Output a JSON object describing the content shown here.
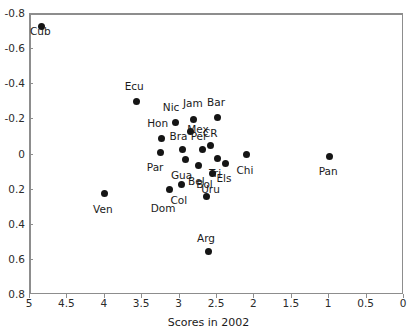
{
  "chart_data": {
    "type": "scatter",
    "title": "",
    "xlabel": "Scores in 2002",
    "ylabel": "",
    "xlim": [
      5,
      0
    ],
    "ylim": [
      -0.8,
      0.8
    ],
    "x_axis_reversed": true,
    "y_axis_reversed": true,
    "grid": false,
    "legend": "none",
    "reference_lines": [
      {
        "name": "horizontal-zero-line",
        "axis": "y",
        "value": 0
      },
      {
        "name": "vertical-line",
        "axis": "x",
        "value": 2.5
      }
    ],
    "xticks": [
      5,
      4.5,
      4,
      3.5,
      3,
      2.5,
      2,
      1.5,
      1,
      0.5,
      0
    ],
    "xtick_labels": [
      "5",
      "4.5",
      "4",
      "3.5",
      "3",
      "2.5",
      "2",
      "1.5",
      "1",
      "0.5",
      "0"
    ],
    "yticks": [
      -0.8,
      -0.6,
      -0.4,
      -0.2,
      0,
      0.2,
      0.4,
      0.6,
      0.8
    ],
    "ytick_labels": [
      "-0.8",
      "-0.6",
      "-0.4",
      "-0.2",
      "0",
      "0.2",
      "0.4",
      "0.6",
      "0.8"
    ],
    "points": [
      {
        "label": "Cub",
        "x": 4.85,
        "y": -0.73,
        "label_dx": -1,
        "label_dy": 5
      },
      {
        "label": "Ecu",
        "x": 3.58,
        "y": -0.3,
        "label_dx": -2,
        "label_dy": -16
      },
      {
        "label": "Nic",
        "x": 3.06,
        "y": -0.18,
        "label_dx": -4,
        "label_dy": -16
      },
      {
        "label": "Jam",
        "x": 2.81,
        "y": -0.2,
        "label_dx": -1,
        "label_dy": -16
      },
      {
        "label": "Bar",
        "x": 2.5,
        "y": -0.21,
        "label_dx": -1,
        "label_dy": -16
      },
      {
        "label": "Hon",
        "x": 3.24,
        "y": -0.09,
        "label_dx": -4,
        "label_dy": -16
      },
      {
        "label": "Mex",
        "x": 2.86,
        "y": -0.13,
        "label_dx": 8,
        "label_dy": -3
      },
      {
        "label": "Per",
        "x": 2.7,
        "y": -0.03,
        "label_dx": -3,
        "label_dy": -13
      },
      {
        "label": "CR",
        "x": 2.59,
        "y": -0.05,
        "label_dx": 0,
        "label_dy": -13
      },
      {
        "label": "Bra",
        "x": 2.96,
        "y": -0.03,
        "label_dx": -4,
        "label_dy": -13
      },
      {
        "label": "Par",
        "x": 3.26,
        "y": -0.01,
        "label_dx": -5,
        "label_dy": 14
      },
      {
        "label": "Gua",
        "x": 2.92,
        "y": 0.03,
        "label_dx": -4,
        "label_dy": 15
      },
      {
        "label": "Bel",
        "x": 2.75,
        "y": 0.06,
        "label_dx": -2,
        "label_dy": 16
      },
      {
        "label": "Tri",
        "x": 2.5,
        "y": 0.02,
        "label_dx": -2,
        "label_dy": 15
      },
      {
        "label": "Els",
        "x": 2.38,
        "y": 0.05,
        "label_dx": -2,
        "label_dy": 15
      },
      {
        "label": "Chi",
        "x": 2.1,
        "y": 0.0,
        "label_dx": -2,
        "label_dy": 15
      },
      {
        "label": "Pan",
        "x": 1.0,
        "y": 0.01,
        "label_dx": -1,
        "label_dy": 15
      },
      {
        "label": "Uru",
        "x": 2.56,
        "y": 0.11,
        "label_dx": -2,
        "label_dy": 15
      },
      {
        "label": "Col",
        "x": 2.97,
        "y": 0.17,
        "label_dx": -3,
        "label_dy": 16
      },
      {
        "label": "Dom",
        "x": 3.14,
        "y": 0.2,
        "label_dx": -6,
        "label_dy": 18
      },
      {
        "label": "Ven",
        "x": 4.0,
        "y": 0.22,
        "label_dx": -2,
        "label_dy": 16
      },
      {
        "label": "Bol",
        "x": 2.64,
        "y": 0.24,
        "label_dx": -2,
        "label_dy": -13
      },
      {
        "label": "Arg",
        "x": 2.62,
        "y": 0.55,
        "label_dx": -2,
        "label_dy": -13
      }
    ]
  }
}
